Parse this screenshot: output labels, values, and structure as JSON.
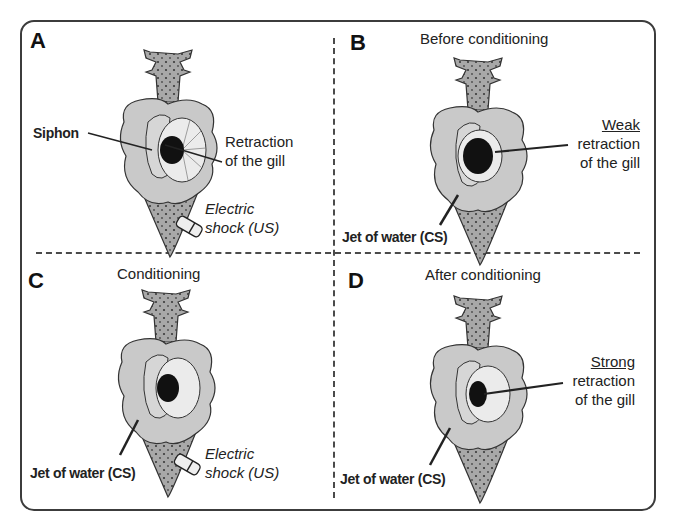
{
  "figure": {
    "panels": [
      {
        "letter": "A",
        "title": "",
        "labels": {
          "siphon": "Siphon",
          "retraction_line1": "Retraction",
          "retraction_line2": "of the gill",
          "shock_line1": "Electric",
          "shock_line2": "shock (US)"
        }
      },
      {
        "letter": "B",
        "title": "Before conditioning",
        "labels": {
          "strength": "Weak",
          "retraction_line1": "retraction",
          "retraction_line2": "of the gill",
          "jet": "Jet of water (CS)"
        }
      },
      {
        "letter": "C",
        "title": "Conditioning",
        "labels": {
          "jet": "Jet of water (CS)",
          "shock_line1": "Electric",
          "shock_line2": "shock (US)"
        }
      },
      {
        "letter": "D",
        "title": "After conditioning",
        "labels": {
          "strength": "Strong",
          "retraction_line1": "retraction",
          "retraction_line2": "of the gill",
          "jet": "Jet of water (CS)"
        }
      }
    ],
    "colors": {
      "border": "#3c3c3c",
      "body_fill": "#a8a8a8",
      "mantle_fill": "#c9c9c9",
      "gill_fill": "#ebebeb",
      "gill_core": "#111111"
    }
  }
}
